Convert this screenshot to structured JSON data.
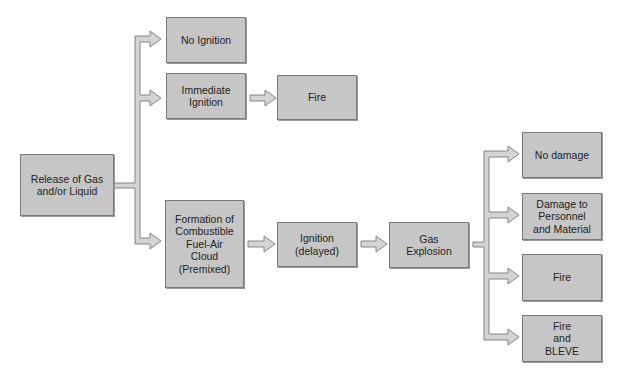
{
  "diagram": {
    "type": "flowchart",
    "nodes": {
      "release": "Release of Gas\nand/or Liquid",
      "no_ignition": "No Ignition",
      "immediate_ignition": "Immediate\nIgnition",
      "fire_immediate": "Fire",
      "formation": "Formation of\nCombustible\nFuel-Air\nCloud\n(Premixed)",
      "ignition_delayed": "Ignition\n(delayed)",
      "gas_explosion": "Gas\nExplosion",
      "no_damage": "No damage",
      "damage": "Damage to\nPersonnel\nand Material",
      "fire_explosion": "Fire",
      "fire_bleve": "Fire\nand\nBLEVE"
    },
    "edges": [
      [
        "release",
        "no_ignition"
      ],
      [
        "release",
        "immediate_ignition"
      ],
      [
        "release",
        "formation"
      ],
      [
        "immediate_ignition",
        "fire_immediate"
      ],
      [
        "formation",
        "ignition_delayed"
      ],
      [
        "ignition_delayed",
        "gas_explosion"
      ],
      [
        "gas_explosion",
        "no_damage"
      ],
      [
        "gas_explosion",
        "damage"
      ],
      [
        "gas_explosion",
        "fire_explosion"
      ],
      [
        "gas_explosion",
        "fire_bleve"
      ]
    ],
    "colors": {
      "box_fill": "#c6c6c6",
      "box_border": "#7a7a7a",
      "arrow_fill": "#d4d4d4",
      "arrow_stroke": "#7a7a7a"
    }
  }
}
